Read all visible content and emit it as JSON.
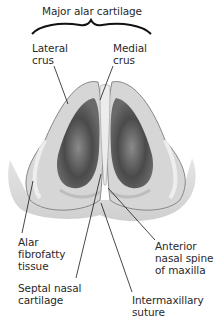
{
  "diagram": {
    "group_label": "Major alar cartilage",
    "labels": [
      {
        "id": "lateral-crus",
        "text": "Lateral\ncrus"
      },
      {
        "id": "medial-crus",
        "text": "Medial\ncrus"
      },
      {
        "id": "alar-fibrofatty-tissue",
        "text": "Alar\nfibrofatty\ntissue"
      },
      {
        "id": "septal-nasal-cartilage",
        "text": "Septal nasal\ncartilage"
      },
      {
        "id": "anterior-nasal-spine",
        "text": "Anterior\nnasal spine\nof maxilla"
      },
      {
        "id": "intermaxillary-suture",
        "text": "Intermaxillary\nsuture"
      }
    ],
    "colors": {
      "background": "#ffffff",
      "cartilage_light": "#e4e4e4",
      "cartilage_mid": "#b8b8b8",
      "cavity_dark": "#4a4a4a",
      "leader_line": "#1a1a1a"
    }
  }
}
